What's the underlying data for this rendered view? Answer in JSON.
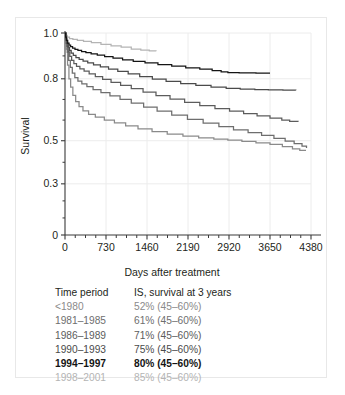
{
  "chart_data": {
    "type": "line",
    "title": "",
    "xlabel": "Days after treatment",
    "ylabel": "Survival",
    "xlim": [
      0,
      4380
    ],
    "ylim": [
      0,
      1.0
    ],
    "x_ticks": [
      0,
      730,
      1460,
      2190,
      2920,
      3650,
      4380
    ],
    "x_tick_labels": [
      "0",
      "730",
      "1460",
      "2190",
      "2920",
      "3650",
      "4380"
    ],
    "y_ticks": [
      0,
      0.3,
      0.5,
      0.8,
      1.0
    ],
    "y_tick_labels": [
      "0",
      "0.3",
      "0.5",
      "0.8",
      "1.0"
    ],
    "y_tick_positions_frac": [
      1.0,
      0.7467,
      0.5333,
      0.2267,
      0.0
    ],
    "grid": "major-x-and-y",
    "legend_position": "below-plot-as-table",
    "series": [
      {
        "name": "<1980",
        "color": "#8a8a8a",
        "survival_at_3_years": "52%",
        "points": [
          [
            0,
            1.0
          ],
          [
            20,
            0.93
          ],
          [
            45,
            0.86
          ],
          [
            70,
            0.8
          ],
          [
            100,
            0.76
          ],
          [
            140,
            0.72
          ],
          [
            190,
            0.69
          ],
          [
            250,
            0.665
          ],
          [
            320,
            0.645
          ],
          [
            420,
            0.628
          ],
          [
            540,
            0.614
          ],
          [
            700,
            0.6
          ],
          [
            880,
            0.586
          ],
          [
            1080,
            0.572
          ],
          [
            1300,
            0.558
          ],
          [
            1550,
            0.544
          ],
          [
            1820,
            0.532
          ],
          [
            2100,
            0.522
          ],
          [
            2380,
            0.514
          ],
          [
            2650,
            0.508
          ],
          [
            2900,
            0.503
          ],
          [
            3150,
            0.497
          ],
          [
            3400,
            0.49
          ],
          [
            3650,
            0.483
          ],
          [
            3870,
            0.473
          ],
          [
            4050,
            0.462
          ],
          [
            4180,
            0.455
          ],
          [
            4280,
            0.452
          ]
        ]
      },
      {
        "name": "1981–1985",
        "color": "#6e6e6e",
        "survival_at_3_years": "61%",
        "points": [
          [
            0,
            1.0
          ],
          [
            18,
            0.955
          ],
          [
            40,
            0.915
          ],
          [
            65,
            0.88
          ],
          [
            95,
            0.85
          ],
          [
            130,
            0.825
          ],
          [
            175,
            0.805
          ],
          [
            230,
            0.789
          ],
          [
            300,
            0.775
          ],
          [
            390,
            0.762
          ],
          [
            500,
            0.748
          ],
          [
            640,
            0.733
          ],
          [
            800,
            0.717
          ],
          [
            980,
            0.7
          ],
          [
            1180,
            0.682
          ],
          [
            1400,
            0.663
          ],
          [
            1640,
            0.644
          ],
          [
            1900,
            0.624
          ],
          [
            2180,
            0.604
          ],
          [
            2460,
            0.585
          ],
          [
            2740,
            0.568
          ],
          [
            3000,
            0.553
          ],
          [
            3260,
            0.539
          ],
          [
            3500,
            0.526
          ],
          [
            3720,
            0.512
          ],
          [
            3920,
            0.498
          ],
          [
            4080,
            0.487
          ],
          [
            4220,
            0.475
          ],
          [
            4300,
            0.466
          ]
        ]
      },
      {
        "name": "1986–1989",
        "color": "#5c5c5c",
        "survival_at_3_years": "71%",
        "points": [
          [
            0,
            1.0
          ],
          [
            15,
            0.968
          ],
          [
            35,
            0.942
          ],
          [
            58,
            0.918
          ],
          [
            85,
            0.898
          ],
          [
            118,
            0.88
          ],
          [
            158,
            0.866
          ],
          [
            205,
            0.854
          ],
          [
            265,
            0.843
          ],
          [
            340,
            0.833
          ],
          [
            430,
            0.822
          ],
          [
            540,
            0.81
          ],
          [
            670,
            0.797
          ],
          [
            820,
            0.783
          ],
          [
            990,
            0.768
          ],
          [
            1180,
            0.752
          ],
          [
            1390,
            0.736
          ],
          [
            1620,
            0.719
          ],
          [
            1870,
            0.702
          ],
          [
            2130,
            0.686
          ],
          [
            2400,
            0.67
          ],
          [
            2670,
            0.656
          ],
          [
            2930,
            0.643
          ],
          [
            3180,
            0.631
          ],
          [
            3420,
            0.62
          ],
          [
            3650,
            0.609
          ],
          [
            3860,
            0.6
          ],
          [
            4000,
            0.594
          ],
          [
            4150,
            0.592
          ]
        ]
      },
      {
        "name": "1990–1993",
        "color": "#4a4a4a",
        "survival_at_3_years": "75%",
        "points": [
          [
            0,
            1.0
          ],
          [
            14,
            0.975
          ],
          [
            32,
            0.955
          ],
          [
            54,
            0.938
          ],
          [
            80,
            0.924
          ],
          [
            110,
            0.912
          ],
          [
            148,
            0.902
          ],
          [
            195,
            0.893
          ],
          [
            252,
            0.885
          ],
          [
            322,
            0.877
          ],
          [
            405,
            0.869
          ],
          [
            508,
            0.861
          ],
          [
            630,
            0.852
          ],
          [
            775,
            0.842
          ],
          [
            940,
            0.832
          ],
          [
            1125,
            0.821
          ],
          [
            1330,
            0.81
          ],
          [
            1555,
            0.798
          ],
          [
            1800,
            0.787
          ],
          [
            2060,
            0.777
          ],
          [
            2330,
            0.768
          ],
          [
            2600,
            0.76
          ],
          [
            2870,
            0.754
          ],
          [
            3120,
            0.75
          ],
          [
            3380,
            0.748
          ],
          [
            3620,
            0.746
          ],
          [
            3880,
            0.745
          ],
          [
            4110,
            0.744
          ]
        ]
      },
      {
        "name": "1994–1997",
        "color": "#141414",
        "survival_at_3_years": "80%",
        "points": [
          [
            0,
            1.0
          ],
          [
            12,
            0.982
          ],
          [
            28,
            0.968
          ],
          [
            48,
            0.956
          ],
          [
            72,
            0.947
          ],
          [
            100,
            0.94
          ],
          [
            135,
            0.934
          ],
          [
            178,
            0.929
          ],
          [
            230,
            0.924
          ],
          [
            295,
            0.919
          ],
          [
            372,
            0.914
          ],
          [
            465,
            0.909
          ],
          [
            575,
            0.903
          ],
          [
            705,
            0.897
          ],
          [
            855,
            0.89
          ],
          [
            1025,
            0.883
          ],
          [
            1215,
            0.876
          ],
          [
            1425,
            0.869
          ],
          [
            1655,
            0.862
          ],
          [
            1900,
            0.855
          ],
          [
            2150,
            0.848
          ],
          [
            2400,
            0.842
          ],
          [
            2620,
            0.836
          ],
          [
            2780,
            0.83
          ],
          [
            2900,
            0.827
          ],
          [
            3100,
            0.826
          ],
          [
            3400,
            0.825
          ],
          [
            3650,
            0.825
          ]
        ]
      },
      {
        "name": "1998–2001",
        "color": "#b4b4b4",
        "survival_at_3_years": "85%",
        "points": [
          [
            0,
            1.0
          ],
          [
            15,
            0.99
          ],
          [
            40,
            0.982
          ],
          [
            80,
            0.976
          ],
          [
            140,
            0.972
          ],
          [
            220,
            0.968
          ],
          [
            330,
            0.963
          ],
          [
            470,
            0.958
          ],
          [
            640,
            0.95
          ],
          [
            820,
            0.944
          ],
          [
            1000,
            0.938
          ],
          [
            1180,
            0.93
          ],
          [
            1350,
            0.925
          ],
          [
            1500,
            0.922
          ],
          [
            1620,
            0.92
          ]
        ]
      }
    ]
  },
  "legend": {
    "header_period": "Time period",
    "header_value": "IS, survival at 3 years",
    "rows": [
      {
        "period": "<1980",
        "value": "52% (45–60%)",
        "color": "#8a8a8a",
        "bold": false
      },
      {
        "period": "1981–1985",
        "value": "61% (45–60%)",
        "color": "#6e6e6e",
        "bold": false
      },
      {
        "period": "1986–1989",
        "value": "71% (45–60%)",
        "color": "#5c5c5c",
        "bold": false
      },
      {
        "period": "1990–1993",
        "value": "75% (45–60%)",
        "color": "#4a4a4a",
        "bold": false
      },
      {
        "period": "1994–1997",
        "value": "80% (45–60%)",
        "color": "#141414",
        "bold": true
      },
      {
        "period": "1998–2001",
        "value": "85% (45–60%)",
        "color": "#b4b4b4",
        "bold": false
      }
    ]
  },
  "style": {
    "axis_color": "#3a3a3a",
    "grid_color": "#ececec",
    "tick_label_color": "#231f20",
    "border_color": "#e8e8e8",
    "background": "#ffffff"
  }
}
